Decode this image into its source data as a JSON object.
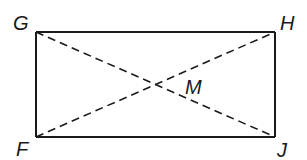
{
  "diagram": {
    "type": "geometry",
    "shape": "rectangle",
    "colors": {
      "stroke": "#1a1a1a",
      "background": "#ffffff"
    },
    "vertices": [
      {
        "label": "G",
        "x": 36,
        "y": 32
      },
      {
        "label": "H",
        "x": 275,
        "y": 32
      },
      {
        "label": "J",
        "x": 275,
        "y": 137
      },
      {
        "label": "F",
        "x": 36,
        "y": 137
      }
    ],
    "intersection": {
      "label": "M",
      "x": 155,
      "y": 84
    },
    "labels": {
      "G": "G",
      "H": "H",
      "F": "F",
      "J": "J",
      "M": "M"
    },
    "segments": [
      {
        "from": "G",
        "to": "H",
        "style": "solid"
      },
      {
        "from": "H",
        "to": "J",
        "style": "solid"
      },
      {
        "from": "J",
        "to": "F",
        "style": "solid"
      },
      {
        "from": "F",
        "to": "G",
        "style": "solid"
      },
      {
        "from": "G",
        "to": "J",
        "style": "dashed"
      },
      {
        "from": "F",
        "to": "H",
        "style": "dashed"
      }
    ]
  }
}
